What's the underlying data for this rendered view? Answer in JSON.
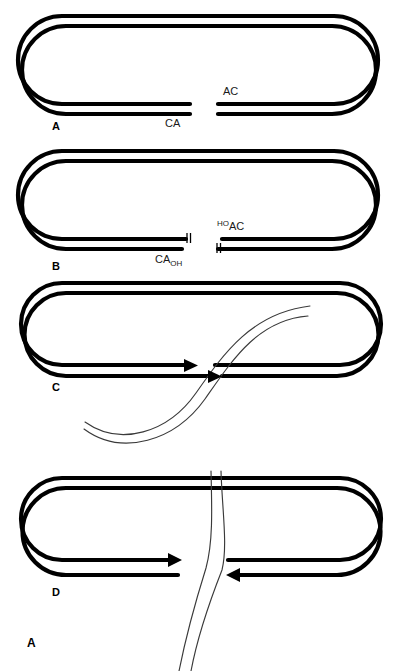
{
  "figure": {
    "label": "A",
    "background_color": "#ffffff",
    "host_dna_color": "#000000",
    "donor_dna_color": "#3a3a3a",
    "width": 403,
    "height": 671
  },
  "panels": [
    {
      "id": "panel-a",
      "letter": "A",
      "left_end_label": "CA",
      "right_end_label": "AC",
      "left_end_sub": "",
      "right_end_sup": "",
      "has_ticks": false,
      "has_arrows": false,
      "has_donor_dna": false
    },
    {
      "id": "panel-b",
      "letter": "B",
      "left_end_label": "CA",
      "right_end_label": "AC",
      "left_end_sub": "OH",
      "right_end_sup": "HO",
      "has_ticks": true,
      "has_arrows": false,
      "has_donor_dna": false
    },
    {
      "id": "panel-c",
      "letter": "C",
      "left_end_label": "",
      "right_end_label": "",
      "left_end_sub": "",
      "right_end_sup": "",
      "has_ticks": false,
      "has_arrows": true,
      "has_donor_dna": true
    },
    {
      "id": "panel-d",
      "letter": "D",
      "left_end_label": "",
      "right_end_label": "",
      "left_end_sub": "",
      "right_end_sup": "",
      "has_ticks": false,
      "has_arrows": true,
      "has_donor_dna": true
    }
  ]
}
